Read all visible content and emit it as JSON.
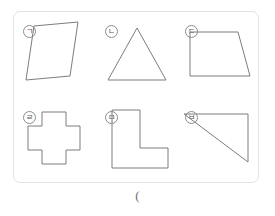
{
  "panel": {
    "border_color": "#e2e2e2",
    "stroke_color": "#7d7d7d",
    "marker_color": "#5a5a5a"
  },
  "figures": [
    {
      "marker": "ㄱ",
      "name": "parallelogram",
      "points": "20,14 64,10 56,64 12,68"
    },
    {
      "marker": "ㄴ",
      "name": "triangle",
      "points": "41,16 70,68 12,68"
    },
    {
      "marker": "ㄷ",
      "name": "trapezoid",
      "points": "14,20 62,20 74,64 14,64"
    },
    {
      "marker": "ㄹ",
      "name": "cross",
      "points": "28,14 52,14 52,28 66,28 66,52 52,52 52,66 28,66 28,52 14,52 14,28 28,28"
    },
    {
      "marker": "ㅁ",
      "name": "l-shape",
      "points": "16,12 44,12 44,50 72,50 72,70 16,70"
    },
    {
      "marker": "ㅂ",
      "name": "right-triangle",
      "points": "8,16 72,16 72,64"
    }
  ],
  "answer_field": {
    "text": "("
  }
}
